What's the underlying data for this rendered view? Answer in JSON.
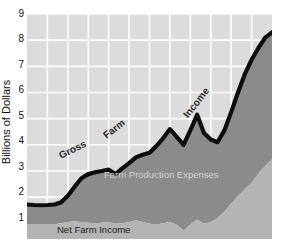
{
  "chart_data": {
    "type": "area",
    "title": "",
    "subtitle": "",
    "xlabel": "",
    "ylabel": "Billions of Dollars",
    "ylim": [
      0.4,
      9
    ],
    "yticks": [
      9,
      8,
      7,
      6,
      5,
      4,
      3,
      2,
      1
    ],
    "ytick_labels": [
      "9",
      "8",
      "7",
      "6",
      "5",
      "4",
      "3",
      "2",
      "1"
    ],
    "xlim": [
      0,
      36
    ],
    "grid": true,
    "legend": "inline-annotations",
    "colors": {
      "plot_background": "#dcdcdc",
      "gridline": "#ffffff",
      "expenses_fill": "#8b8b8b",
      "net_income_fill": "#b4b4b4",
      "gross_income_line": "#0d0d0d",
      "axis_text": "#111111",
      "expenses_label_text": "#d2d2d2"
    },
    "annotations": [
      {
        "name": "gross-farm-income-label",
        "text": "Gross",
        "rotation": -27
      },
      {
        "name": "gross-farm-income-label",
        "text": "Farm",
        "rotation": -38
      },
      {
        "name": "gross-farm-income-label",
        "text": "Income",
        "rotation": -52
      },
      {
        "name": "farm-production-expenses-label",
        "text": "Farm Production Expenses",
        "rotation": 0
      },
      {
        "name": "net-farm-income-label",
        "text": "Net Farm Income",
        "rotation": 0
      }
    ],
    "series": [
      {
        "name": "Gross Farm Income",
        "kind": "line",
        "values": [
          1.72,
          1.7,
          1.69,
          1.7,
          1.72,
          1.8,
          2.05,
          2.4,
          2.72,
          2.88,
          2.95,
          3.0,
          3.05,
          2.88,
          3.1,
          3.3,
          3.52,
          3.62,
          3.7,
          3.95,
          4.25,
          4.6,
          4.3,
          4.0,
          4.55,
          5.15,
          4.45,
          4.2,
          4.1,
          4.55,
          5.25,
          6.0,
          6.7,
          7.25,
          7.7,
          8.1,
          8.3
        ]
      },
      {
        "name": "Farm Production Expenses",
        "kind": "area-upper-boundary-of-net-income",
        "values": [
          0.95,
          0.95,
          0.95,
          0.95,
          0.96,
          1.0,
          1.05,
          1.08,
          1.05,
          1.02,
          1.0,
          1.02,
          1.05,
          0.98,
          1.0,
          1.05,
          1.12,
          1.05,
          0.98,
          0.95,
          1.0,
          1.05,
          0.95,
          0.72,
          0.95,
          1.15,
          0.98,
          1.05,
          1.2,
          1.45,
          1.75,
          2.05,
          2.3,
          2.55,
          2.9,
          3.2,
          3.45
        ]
      },
      {
        "name": "Net Farm Income",
        "kind": "area-lower-band",
        "values": [
          0.95,
          0.95,
          0.95,
          0.95,
          0.96,
          1.0,
          1.05,
          1.08,
          1.05,
          1.02,
          1.0,
          1.02,
          1.05,
          0.98,
          1.0,
          1.05,
          1.12,
          1.05,
          0.98,
          0.95,
          1.0,
          1.05,
          0.95,
          0.72,
          0.95,
          1.15,
          0.98,
          1.05,
          1.2,
          1.45,
          1.75,
          2.05,
          2.3,
          2.55,
          2.9,
          3.2,
          3.45
        ]
      }
    ],
    "gridlines": {
      "vertical_count": 11,
      "horizontal_count": 9
    }
  },
  "axis": {
    "y_label": "Billions of Dollars",
    "ticks": [
      "9",
      "8",
      "7",
      "6",
      "5",
      "4",
      "3",
      "2",
      "1"
    ]
  },
  "labels": {
    "gross": "Gross",
    "farm": "Farm",
    "income": "Income",
    "expenses": "Farm Production Expenses",
    "net_income": "Net Farm Income"
  },
  "clipped_header": {
    "text": ""
  }
}
